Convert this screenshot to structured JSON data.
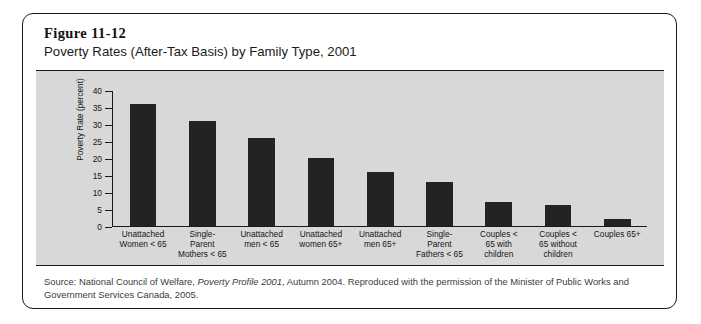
{
  "figure": {
    "number": "Figure 11-12",
    "title": "Poverty Rates (After-Tax Basis) by Family Type, 2001"
  },
  "source_note": {
    "prefix": "Source: National Council of Welfare, ",
    "italic": "Poverty Profile 2001",
    "suffix": ", Autumn 2004. Reproduced with the permission of the Minister of Public Works and Government Services Canada, 2005."
  },
  "colors": {
    "bar": "#232323",
    "panel_background": "#d8d8d8",
    "card_background": "#ffffff",
    "axis": "#1a1a1a"
  },
  "chart_data": {
    "type": "bar",
    "title": "Poverty Rates (After-Tax Basis) by Family Type, 2001",
    "xlabel": "",
    "ylabel": "Poverty Rate (percent)",
    "ylim": [
      0,
      40
    ],
    "yticks": [
      0,
      5,
      10,
      15,
      20,
      25,
      30,
      35,
      40
    ],
    "grid": false,
    "legend": "none",
    "categories": [
      "Unattached Women < 65",
      "Single-Parent Mothers < 65",
      "Unattached men < 65",
      "Unattached women 65+",
      "Unattached men 65+",
      "Single-Parent Fathers < 65",
      "Couples < 65 with children",
      "Couples < 65 without children",
      "Couples 65+"
    ],
    "category_lines": [
      [
        "Unattached",
        "Women < 65"
      ],
      [
        "Single-",
        "Parent",
        "Mothers < 65"
      ],
      [
        "Unattached",
        "men < 65"
      ],
      [
        "Unattached",
        "women 65+"
      ],
      [
        "Unattached",
        "men 65+"
      ],
      [
        "Single-",
        "Parent",
        "Fathers < 65"
      ],
      [
        "Couples <",
        "65 with",
        "children"
      ],
      [
        "Couples <",
        "65 without",
        "children"
      ],
      [
        "Couples 65+"
      ]
    ],
    "values": [
      36,
      31,
      26,
      20,
      16,
      13,
      7,
      6,
      2
    ]
  }
}
